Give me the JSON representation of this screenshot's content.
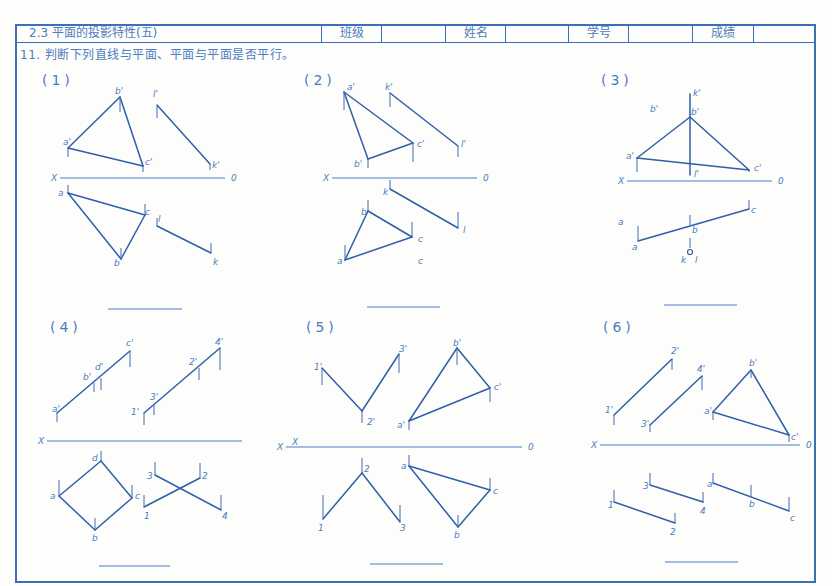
{
  "header": {
    "title": "2.3  平面的投影特性(五)",
    "fields": [
      {
        "label": "班级",
        "value": ""
      },
      {
        "label": "姓名",
        "value": ""
      },
      {
        "label": "学号",
        "value": ""
      },
      {
        "label": "成绩",
        "value": ""
      }
    ]
  },
  "instruction": "11. 判断下列直线与平面、平面与平面是否平行。",
  "colors": {
    "line": "#2f5fa8",
    "frame": "#3d6fb4",
    "text": "#4d7cc0",
    "paper": "#fdfdfb"
  },
  "problems": [
    {
      "id": "1",
      "label": "(1)",
      "label_pos": [
        42,
        80
      ],
      "axis": {
        "x1": 60,
        "x2": 225,
        "y": 178,
        "left_label": "X",
        "right_label": "0"
      },
      "answer_line": {
        "x1": 108,
        "x2": 182,
        "y": 309
      },
      "segments": [
        [
          [
            68,
            148
          ],
          [
            120,
            97
          ]
        ],
        [
          [
            120,
            97
          ],
          [
            143,
            166
          ]
        ],
        [
          [
            68,
            148
          ],
          [
            143,
            166
          ]
        ],
        [
          [
            157,
            105
          ],
          [
            210,
            164
          ]
        ],
        [
          [
            68,
            193
          ],
          [
            145,
            215
          ]
        ],
        [
          [
            68,
            193
          ],
          [
            121,
            259
          ]
        ],
        [
          [
            121,
            259
          ],
          [
            145,
            215
          ]
        ],
        [
          [
            157,
            226
          ],
          [
            211,
            253
          ]
        ]
      ],
      "ticks": [
        [
          120,
          97,
          112
        ],
        [
          68,
          148,
          157
        ],
        [
          143,
          166,
          172
        ],
        [
          157,
          105,
          118
        ],
        [
          210,
          164,
          170
        ],
        [
          68,
          193,
          185
        ],
        [
          145,
          215,
          204
        ],
        [
          121,
          259,
          248
        ],
        [
          157,
          226,
          218
        ],
        [
          211,
          253,
          243
        ]
      ],
      "points": [
        {
          "t": "b'",
          "x": 115,
          "y": 94
        },
        {
          "t": "a'",
          "x": 63,
          "y": 145
        },
        {
          "t": "c'",
          "x": 145,
          "y": 165
        },
        {
          "t": "l'",
          "x": 153,
          "y": 97
        },
        {
          "t": "k'",
          "x": 212,
          "y": 168
        },
        {
          "t": "a",
          "x": 58,
          "y": 196
        },
        {
          "t": "c",
          "x": 145,
          "y": 215
        },
        {
          "t": "l",
          "x": 158,
          "y": 222
        },
        {
          "t": "b",
          "x": 114,
          "y": 266
        },
        {
          "t": "k",
          "x": 213,
          "y": 265
        }
      ]
    },
    {
      "id": "2",
      "label": "(2)",
      "label_pos": [
        304,
        80
      ],
      "axis": {
        "x1": 332,
        "x2": 477,
        "y": 178,
        "left_label": "X",
        "right_label": "0"
      },
      "answer_line": {
        "x1": 367,
        "x2": 440,
        "y": 307
      },
      "segments": [
        [
          [
            344,
            92
          ],
          [
            368,
            159
          ]
        ],
        [
          [
            344,
            92
          ],
          [
            413,
            143
          ]
        ],
        [
          [
            368,
            159
          ],
          [
            413,
            143
          ]
        ],
        [
          [
            390,
            93
          ],
          [
            458,
            146
          ]
        ],
        [
          [
            390,
            189
          ],
          [
            458,
            228
          ]
        ],
        [
          [
            368,
            211
          ],
          [
            412,
            237
          ]
        ],
        [
          [
            345,
            260
          ],
          [
            368,
            211
          ]
        ],
        [
          [
            345,
            260
          ],
          [
            412,
            237
          ]
        ]
      ],
      "ticks": [
        [
          344,
          92,
          110
        ],
        [
          413,
          143,
          162
        ],
        [
          368,
          159,
          168
        ],
        [
          390,
          93,
          107
        ],
        [
          458,
          146,
          157
        ],
        [
          390,
          189,
          180
        ],
        [
          458,
          228,
          212
        ],
        [
          368,
          211,
          200
        ],
        [
          412,
          237,
          222
        ],
        [
          345,
          260,
          245
        ]
      ],
      "points": [
        {
          "t": "a'",
          "x": 347,
          "y": 90
        },
        {
          "t": "k'",
          "x": 385,
          "y": 90
        },
        {
          "t": "c'",
          "x": 417,
          "y": 147
        },
        {
          "t": "l'",
          "x": 461,
          "y": 147
        },
        {
          "t": "b'",
          "x": 354,
          "y": 167
        },
        {
          "t": "k",
          "x": 383,
          "y": 195
        },
        {
          "t": "b",
          "x": 361,
          "y": 215
        },
        {
          "t": "l",
          "x": 463,
          "y": 233
        },
        {
          "t": "c",
          "x": 418,
          "y": 242
        },
        {
          "t": "a",
          "x": 337,
          "y": 264
        },
        {
          "t": "c",
          "x": 418,
          "y": 264
        }
      ]
    },
    {
      "id": "3",
      "label": "(3)",
      "label_pos": [
        601,
        80
      ],
      "axis": {
        "x1": 627,
        "x2": 772,
        "y": 181,
        "left_label": "X",
        "right_label": "0"
      },
      "answer_line": {
        "x1": 664,
        "x2": 737,
        "y": 305
      },
      "segments": [
        [
          [
            637,
            158
          ],
          [
            690,
            117
          ]
        ],
        [
          [
            690,
            117
          ],
          [
            749,
            170
          ]
        ],
        [
          [
            637,
            158
          ],
          [
            749,
            170
          ]
        ],
        [
          [
            690,
            94
          ],
          [
            690,
            175
          ]
        ],
        [
          [
            638,
            241
          ],
          [
            749,
            209
          ]
        ]
      ],
      "ticks": [
        [
          637,
          158,
          172
        ],
        [
          749,
          170,
          172
        ],
        [
          749,
          209,
          200
        ],
        [
          690,
          225,
          215
        ],
        [
          638,
          241,
          226
        ],
        [
          690,
          248,
          238
        ]
      ],
      "circles": [
        {
          "x": 690,
          "y": 252,
          "r": 2.5
        }
      ],
      "points": [
        {
          "t": "k'",
          "x": 693,
          "y": 96
        },
        {
          "t": "b'",
          "x": 650,
          "y": 112
        },
        {
          "t": "b'",
          "x": 691,
          "y": 115
        },
        {
          "t": "a'",
          "x": 626,
          "y": 159
        },
        {
          "t": "l'",
          "x": 694,
          "y": 177
        },
        {
          "t": "c'",
          "x": 754,
          "y": 171
        },
        {
          "t": "c",
          "x": 751,
          "y": 213
        },
        {
          "t": "a",
          "x": 618,
          "y": 225
        },
        {
          "t": "b",
          "x": 692,
          "y": 233
        },
        {
          "t": "a",
          "x": 632,
          "y": 250
        },
        {
          "t": "k",
          "x": 681,
          "y": 263
        },
        {
          "t": "l",
          "x": 695,
          "y": 263
        }
      ]
    },
    {
      "id": "4",
      "label": "(4)",
      "label_pos": [
        50,
        327
      ],
      "axis": {
        "x1": 47,
        "x2": 242,
        "y": 441,
        "left_label": "X",
        "right_label": ""
      },
      "answer_line": {
        "x1": 99,
        "x2": 170,
        "y": 566
      },
      "segments": [
        [
          [
            57,
            413
          ],
          [
            130,
            351
          ]
        ],
        [
          [
            144,
            413
          ],
          [
            220,
            348
          ]
        ],
        [
          [
            59,
            496
          ],
          [
            101,
            461
          ]
        ],
        [
          [
            101,
            461
          ],
          [
            132,
            498
          ]
        ],
        [
          [
            59,
            496
          ],
          [
            95,
            530
          ]
        ],
        [
          [
            95,
            530
          ],
          [
            132,
            498
          ]
        ],
        [
          [
            155,
            475
          ],
          [
            221,
            510
          ]
        ],
        [
          [
            144,
            507
          ],
          [
            200,
            478
          ]
        ]
      ],
      "ticks": [
        [
          57,
          413,
          422
        ],
        [
          94,
          383,
          392
        ],
        [
          101,
          378,
          390
        ],
        [
          130,
          351,
          367
        ],
        [
          144,
          413,
          425
        ],
        [
          154,
          405,
          415
        ],
        [
          199,
          368,
          380
        ],
        [
          220,
          348,
          370
        ],
        [
          59,
          496,
          480
        ],
        [
          101,
          461,
          451
        ],
        [
          132,
          498,
          485
        ],
        [
          95,
          530,
          518
        ],
        [
          155,
          475,
          462
        ],
        [
          200,
          478,
          463
        ],
        [
          221,
          510,
          495
        ],
        [
          144,
          507,
          495
        ]
      ],
      "points": [
        {
          "t": "c'",
          "x": 126,
          "y": 346
        },
        {
          "t": "d'",
          "x": 95,
          "y": 370
        },
        {
          "t": "b'",
          "x": 83,
          "y": 380
        },
        {
          "t": "a'",
          "x": 52,
          "y": 412
        },
        {
          "t": "4'",
          "x": 215,
          "y": 345
        },
        {
          "t": "2'",
          "x": 189,
          "y": 365
        },
        {
          "t": "3'",
          "x": 150,
          "y": 400
        },
        {
          "t": "1'",
          "x": 131,
          "y": 415
        },
        {
          "t": "d",
          "x": 92,
          "y": 461
        },
        {
          "t": "a",
          "x": 50,
          "y": 499
        },
        {
          "t": "c",
          "x": 135,
          "y": 499
        },
        {
          "t": "b",
          "x": 92,
          "y": 541
        },
        {
          "t": "3",
          "x": 147,
          "y": 479
        },
        {
          "t": "2",
          "x": 202,
          "y": 479
        },
        {
          "t": "1",
          "x": 144,
          "y": 519
        },
        {
          "t": "4",
          "x": 222,
          "y": 519
        }
      ]
    },
    {
      "id": "5",
      "label": "(5)",
      "label_pos": [
        306,
        327
      ],
      "axis": {
        "x1": 286,
        "x2": 522,
        "y": 447,
        "left_label": "X",
        "right_label": "0"
      },
      "answer_line": {
        "x1": 370,
        "x2": 443,
        "y": 564
      },
      "segments": [
        [
          [
            322,
            368
          ],
          [
            362,
            411
          ]
        ],
        [
          [
            362,
            411
          ],
          [
            399,
            354
          ]
        ],
        [
          [
            409,
            421
          ],
          [
            457,
            348
          ]
        ],
        [
          [
            457,
            348
          ],
          [
            490,
            388
          ]
        ],
        [
          [
            409,
            421
          ],
          [
            490,
            388
          ]
        ],
        [
          [
            323,
            519
          ],
          [
            362,
            473
          ]
        ],
        [
          [
            362,
            473
          ],
          [
            400,
            522
          ]
        ],
        [
          [
            409,
            466
          ],
          [
            490,
            490
          ]
        ],
        [
          [
            409,
            466
          ],
          [
            458,
            527
          ]
        ],
        [
          [
            458,
            527
          ],
          [
            490,
            490
          ]
        ]
      ],
      "ticks": [
        [
          322,
          368,
          385
        ],
        [
          399,
          354,
          373
        ],
        [
          362,
          411,
          423
        ],
        [
          457,
          348,
          365
        ],
        [
          490,
          388,
          402
        ],
        [
          409,
          421,
          430
        ],
        [
          362,
          473,
          458
        ],
        [
          323,
          519,
          495
        ],
        [
          400,
          522,
          505
        ],
        [
          409,
          466,
          455
        ],
        [
          490,
          490,
          478
        ],
        [
          458,
          527,
          515
        ]
      ],
      "points": [
        {
          "t": "1'",
          "x": 314,
          "y": 370
        },
        {
          "t": "3'",
          "x": 399,
          "y": 352
        },
        {
          "t": "2'",
          "x": 367,
          "y": 425
        },
        {
          "t": "b'",
          "x": 453,
          "y": 346
        },
        {
          "t": "c'",
          "x": 494,
          "y": 390
        },
        {
          "t": "a'",
          "x": 397,
          "y": 428
        },
        {
          "t": "X",
          "x": 292,
          "y": 445
        },
        {
          "t": "2",
          "x": 364,
          "y": 472
        },
        {
          "t": "a",
          "x": 401,
          "y": 469
        },
        {
          "t": "c",
          "x": 493,
          "y": 494
        },
        {
          "t": "1",
          "x": 318,
          "y": 531
        },
        {
          "t": "3",
          "x": 400,
          "y": 531
        },
        {
          "t": "b",
          "x": 454,
          "y": 538
        }
      ]
    },
    {
      "id": "6",
      "label": "(6)",
      "label_pos": [
        603,
        327
      ],
      "axis": {
        "x1": 600,
        "x2": 800,
        "y": 445,
        "left_label": "X",
        "right_label": "0"
      },
      "answer_line": {
        "x1": 665,
        "x2": 738,
        "y": 562
      },
      "segments": [
        [
          [
            614,
            415
          ],
          [
            672,
            359
          ]
        ],
        [
          [
            650,
            425
          ],
          [
            702,
            376
          ]
        ],
        [
          [
            713,
            412
          ],
          [
            751,
            370
          ]
        ],
        [
          [
            751,
            370
          ],
          [
            789,
            435
          ]
        ],
        [
          [
            713,
            412
          ],
          [
            789,
            435
          ]
        ],
        [
          [
            614,
            502
          ],
          [
            675,
            523
          ]
        ],
        [
          [
            650,
            485
          ],
          [
            703,
            502
          ]
        ],
        [
          [
            713,
            483
          ],
          [
            789,
            511
          ]
        ]
      ],
      "ticks": [
        [
          614,
          415,
          425
        ],
        [
          672,
          359,
          370
        ],
        [
          650,
          425,
          432
        ],
        [
          702,
          376,
          390
        ],
        [
          713,
          412,
          420
        ],
        [
          751,
          370,
          378
        ],
        [
          789,
          435,
          442
        ],
        [
          614,
          502,
          490
        ],
        [
          675,
          523,
          513
        ],
        [
          650,
          485,
          473
        ],
        [
          703,
          502,
          492
        ],
        [
          713,
          483,
          473
        ],
        [
          751,
          497,
          485
        ],
        [
          789,
          511,
          497
        ]
      ],
      "points": [
        {
          "t": "2'",
          "x": 671,
          "y": 354
        },
        {
          "t": "4'",
          "x": 697,
          "y": 372
        },
        {
          "t": "b'",
          "x": 749,
          "y": 366
        },
        {
          "t": "1'",
          "x": 605,
          "y": 413
        },
        {
          "t": "3'",
          "x": 641,
          "y": 427
        },
        {
          "t": "a'",
          "x": 704,
          "y": 414
        },
        {
          "t": "c'",
          "x": 791,
          "y": 440
        },
        {
          "t": "3",
          "x": 643,
          "y": 489
        },
        {
          "t": "a",
          "x": 707,
          "y": 487
        },
        {
          "t": "1",
          "x": 608,
          "y": 508
        },
        {
          "t": "4",
          "x": 700,
          "y": 514
        },
        {
          "t": "b",
          "x": 749,
          "y": 507
        },
        {
          "t": "c",
          "x": 790,
          "y": 521
        },
        {
          "t": "2",
          "x": 670,
          "y": 535
        }
      ]
    }
  ]
}
